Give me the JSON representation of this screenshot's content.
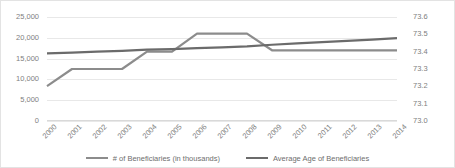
{
  "chart_data": {
    "type": "line",
    "title": "",
    "subtitle": "",
    "xlabel": "",
    "ylabel": "",
    "grid": true,
    "legend_position": "bottom",
    "categories": [
      "2000",
      "2001",
      "2002",
      "2003",
      "2004",
      "2005",
      "2006",
      "2007",
      "2008",
      "2009",
      "2010",
      "2011",
      "2012",
      "2013",
      "2014"
    ],
    "axes": {
      "left": {
        "label": "",
        "ylim": [
          0,
          25000
        ],
        "ticks": [
          0,
          5000,
          10000,
          15000,
          20000,
          25000
        ],
        "tick_labels": [
          "0",
          "5,000",
          "10,000",
          "15,000",
          "20,000",
          "25,000"
        ]
      },
      "right": {
        "label": "",
        "ylim": [
          73.0,
          73.6
        ],
        "ticks": [
          73.0,
          73.1,
          73.2,
          73.3,
          73.4,
          73.5,
          73.6
        ],
        "tick_labels": [
          "73.0",
          "73.1",
          "73.2",
          "73.3",
          "73.4",
          "73.5",
          "73.6"
        ]
      }
    },
    "series": [
      {
        "name": "# of Beneficiaries (in thousands)",
        "axis": "left",
        "color": "#8c8c8c",
        "values": [
          8400,
          12500,
          12500,
          12500,
          16700,
          16700,
          21000,
          21000,
          21000,
          17000,
          17000,
          17000,
          17000,
          17000,
          17000
        ]
      },
      {
        "name": "Average Age of Beneficiaries",
        "axis": "right",
        "color": "#6b6b6b",
        "values": [
          73.39,
          73.395,
          73.4,
          73.405,
          73.412,
          73.415,
          73.42,
          73.425,
          73.43,
          73.44,
          73.448,
          73.455,
          73.462,
          73.47,
          73.478
        ]
      }
    ]
  },
  "legend": {
    "items": [
      {
        "label": "# of Beneficiaries (in thousands)",
        "color": "#8c8c8c"
      },
      {
        "label": "Average Age of Beneficiaries",
        "color": "#6b6b6b"
      }
    ]
  },
  "colors": {
    "background": "#ffffff",
    "grid": "#e8e8e8",
    "border": "#e3e3e3",
    "text": "#808080",
    "series_1": "#8c8c8c",
    "series_2": "#6b6b6b"
  }
}
